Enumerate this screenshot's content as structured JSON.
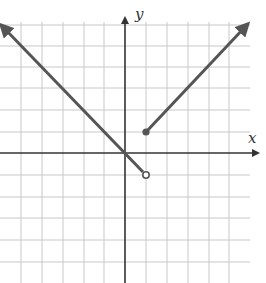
{
  "graph": {
    "x_axis_label": "x",
    "y_axis_label": "y",
    "grid": {
      "spacing_px": 21.5,
      "origin_px": [
        125,
        153
      ],
      "x_range": [
        -5,
        5
      ],
      "y_range": [
        -5,
        6
      ]
    },
    "colors": {
      "curve": "#555555",
      "axis": "#333333",
      "grid": "#c8c8c8"
    },
    "pieces": [
      {
        "description": "y = -x for x < 1",
        "from": [
          -5.8,
          5.8
        ],
        "to": [
          1,
          -1
        ],
        "left_end": "arrow",
        "right_end": "open-circle"
      },
      {
        "description": "y = x for x >= 1",
        "from": [
          1,
          1
        ],
        "to": [
          5.7,
          5.7
        ],
        "left_end": "closed-dot",
        "right_end": "arrow"
      }
    ]
  }
}
